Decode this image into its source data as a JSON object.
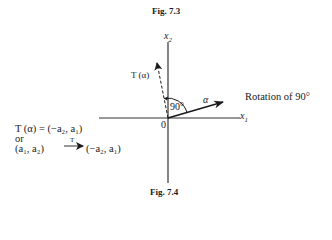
{
  "captions": {
    "top": "Fig. 7.3",
    "bottom": "Fig. 7.4"
  },
  "axes": {
    "x_label": "x",
    "x_sub": "1",
    "y_label": "x",
    "y_sub": "2",
    "origin": "0"
  },
  "vectors": {
    "alpha_label": "α",
    "t_alpha_label": "T (α)",
    "angle_label": "90°"
  },
  "annotation": {
    "rotation": "Rotation of 90°"
  },
  "equations": {
    "line1": "T (α) = (−a₂, a₁)",
    "line2": "or",
    "line3_left": "(a₁, a₂)",
    "line3_arrow_label": "T",
    "line3_right": "(−a₂, a₁)"
  },
  "colors": {
    "ink": "#1a1a1a",
    "axis": "#333333"
  }
}
